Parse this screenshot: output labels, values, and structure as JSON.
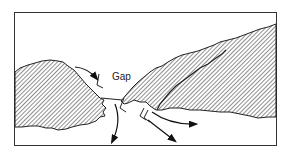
{
  "diagram": {
    "type": "terrain-illustration",
    "labels": {
      "gap": "Gap"
    },
    "colors": {
      "stroke": "#222222",
      "hatch": "#333333",
      "background": "#ffffff"
    },
    "elements": [
      {
        "name": "left-mountain",
        "fill": "diagonal-hatch"
      },
      {
        "name": "right-mountain-back-ridge",
        "fill": "diagonal-hatch"
      },
      {
        "name": "right-mountain-front-ridge",
        "fill": "diagonal-hatch"
      },
      {
        "name": "flow-arrow-approach",
        "direction": "into gap"
      },
      {
        "name": "flow-arrow-down-left",
        "direction": "out of gap, downward"
      },
      {
        "name": "flow-arrow-right",
        "direction": "out of gap, to the right"
      },
      {
        "name": "flow-arrow-down-right",
        "direction": "out of gap, down-right"
      }
    ]
  }
}
